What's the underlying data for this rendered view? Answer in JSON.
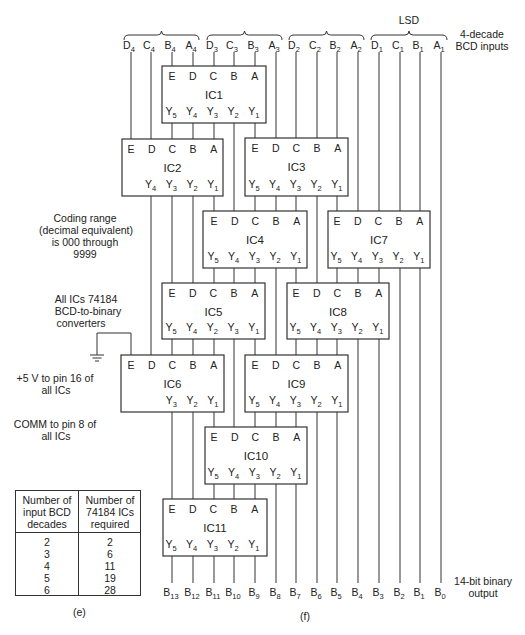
{
  "figure": {
    "caption_e": "(e)",
    "caption_f": "(f)"
  },
  "header": {
    "lsd_label": "LSD",
    "inputs_label_line1": "4-decade",
    "inputs_label_line2": "BCD inputs"
  },
  "inputs": [
    {
      "letter": "D",
      "sub": "4",
      "x": 131
    },
    {
      "letter": "C",
      "sub": "4",
      "x": 151
    },
    {
      "letter": "B",
      "sub": "4",
      "x": 172
    },
    {
      "letter": "A",
      "sub": "4",
      "x": 193
    },
    {
      "letter": "D",
      "sub": "3",
      "x": 214
    },
    {
      "letter": "C",
      "sub": "3",
      "x": 234
    },
    {
      "letter": "B",
      "sub": "3",
      "x": 255
    },
    {
      "letter": "A",
      "sub": "3",
      "x": 276
    },
    {
      "letter": "D",
      "sub": "2",
      "x": 296
    },
    {
      "letter": "C",
      "sub": "2",
      "x": 317
    },
    {
      "letter": "B",
      "sub": "2",
      "x": 337
    },
    {
      "letter": "A",
      "sub": "2",
      "x": 358
    },
    {
      "letter": "D",
      "sub": "1",
      "x": 379
    },
    {
      "letter": "C",
      "sub": "1",
      "x": 400
    },
    {
      "letter": "B",
      "sub": "1",
      "x": 420
    },
    {
      "letter": "A",
      "sub": "1",
      "x": 441
    }
  ],
  "braces": [
    {
      "x1": 124,
      "x2": 199
    },
    {
      "x1": 207,
      "x2": 282
    },
    {
      "x1": 289,
      "x2": 364
    },
    {
      "x1": 371,
      "x2": 447
    }
  ],
  "outputs": [
    {
      "letter": "B",
      "sub": "13",
      "x": 172
    },
    {
      "letter": "B",
      "sub": "12",
      "x": 193
    },
    {
      "letter": "B",
      "sub": "11",
      "x": 214
    },
    {
      "letter": "B",
      "sub": "10",
      "x": 234
    },
    {
      "letter": "B",
      "sub": "9",
      "x": 255
    },
    {
      "letter": "B",
      "sub": "8",
      "x": 276
    },
    {
      "letter": "B",
      "sub": "7",
      "x": 296
    },
    {
      "letter": "B",
      "sub": "6",
      "x": 317
    },
    {
      "letter": "B",
      "sub": "5",
      "x": 337
    },
    {
      "letter": "B",
      "sub": "4",
      "x": 358
    },
    {
      "letter": "B",
      "sub": "3",
      "x": 379
    },
    {
      "letter": "B",
      "sub": "2",
      "x": 400
    },
    {
      "letter": "B",
      "sub": "1",
      "x": 420
    },
    {
      "letter": "B",
      "sub": "0",
      "x": 441
    }
  ],
  "output_label_line1": "14-bit binary",
  "output_label_line2": "output",
  "ics": [
    {
      "name": "IC1",
      "x": 162,
      "y": 66,
      "w": 104,
      "h": 57,
      "pin0": 172,
      "inputs": [
        "E",
        "D",
        "C",
        "B",
        "A"
      ],
      "outputs": [
        [
          "Y",
          "5"
        ],
        [
          "Y",
          "4"
        ],
        [
          "Y",
          "3"
        ],
        [
          "Y",
          "2"
        ],
        [
          "Y",
          "1"
        ]
      ]
    },
    {
      "name": "IC2",
      "x": 122,
      "y": 139,
      "w": 101,
      "h": 57,
      "pin0": 131,
      "inputs": [
        "E",
        "D",
        "C",
        "B",
        "A"
      ],
      "outputs": [
        null,
        [
          "Y",
          "4"
        ],
        [
          "Y",
          "3"
        ],
        [
          "Y",
          "2"
        ],
        [
          "Y",
          "1"
        ]
      ]
    },
    {
      "name": "IC3",
      "x": 245,
      "y": 138,
      "w": 103,
      "h": 58,
      "pin0": 255,
      "inputs": [
        "E",
        "D",
        "C",
        "B",
        "A"
      ],
      "outputs": [
        [
          "Y",
          "5"
        ],
        [
          "Y",
          "4"
        ],
        [
          "Y",
          "3"
        ],
        [
          "Y",
          "2"
        ],
        [
          "Y",
          "1"
        ]
      ]
    },
    {
      "name": "IC4",
      "x": 203,
      "y": 211,
      "w": 104,
      "h": 57,
      "pin0": 214,
      "inputs": [
        "E",
        "D",
        "C",
        "B",
        "A"
      ],
      "outputs": [
        [
          "Y",
          "5"
        ],
        [
          "Y",
          "4"
        ],
        [
          "Y",
          "3"
        ],
        [
          "Y",
          "2"
        ],
        [
          "Y",
          "1"
        ]
      ]
    },
    {
      "name": "IC7",
      "x": 328,
      "y": 211,
      "w": 102,
      "h": 57,
      "pin0": 337,
      "inputs": [
        "E",
        "D",
        "C",
        "B",
        "A"
      ],
      "outputs": [
        [
          "Y",
          "5"
        ],
        [
          "Y",
          "4"
        ],
        [
          "Y",
          "3"
        ],
        [
          "Y",
          "2"
        ],
        [
          "Y",
          "1"
        ]
      ]
    },
    {
      "name": "IC5",
      "x": 162,
      "y": 283,
      "w": 103,
      "h": 56,
      "pin0": 172,
      "inputs": [
        "E",
        "D",
        "C",
        "B",
        "A"
      ],
      "outputs": [
        [
          "Y",
          "5"
        ],
        [
          "Y",
          "4"
        ],
        [
          "Y",
          "2"
        ],
        [
          "Y",
          "3"
        ],
        [
          "Y",
          "1"
        ]
      ]
    },
    {
      "name": "IC8",
      "x": 287,
      "y": 283,
      "w": 102,
      "h": 56,
      "pin0": 296,
      "inputs": [
        "E",
        "D",
        "C",
        "B",
        "A"
      ],
      "outputs": [
        [
          "Y",
          "5"
        ],
        [
          "Y",
          "4"
        ],
        [
          "Y",
          "3"
        ],
        [
          "Y",
          "2"
        ],
        [
          "Y",
          "1"
        ]
      ]
    },
    {
      "name": "IC6",
      "x": 121,
      "y": 355,
      "w": 103,
      "h": 57,
      "pin0": 131,
      "inputs": [
        "E",
        "D",
        "C",
        "B",
        "A"
      ],
      "outputs": [
        null,
        null,
        [
          "Y",
          "3"
        ],
        [
          "Y",
          "2"
        ],
        [
          "Y",
          "1"
        ]
      ]
    },
    {
      "name": "IC9",
      "x": 245,
      "y": 355,
      "w": 103,
      "h": 57,
      "pin0": 255,
      "inputs": [
        "E",
        "D",
        "C",
        "B",
        "A"
      ],
      "outputs": [
        [
          "Y",
          "5"
        ],
        [
          "Y",
          "4"
        ],
        [
          "Y",
          "3"
        ],
        [
          "Y",
          "2"
        ],
        [
          "Y",
          "1"
        ]
      ]
    },
    {
      "name": "IC10",
      "x": 205,
      "y": 427,
      "w": 102,
      "h": 57,
      "pin0": 214,
      "inputs": [
        "E",
        "D",
        "C",
        "B",
        "A"
      ],
      "outputs": [
        [
          "Y",
          "5"
        ],
        [
          "Y",
          "4"
        ],
        [
          "Y",
          "3"
        ],
        [
          "Y",
          "2"
        ],
        [
          "Y",
          "1"
        ]
      ]
    },
    {
      "name": "IC11",
      "x": 163,
      "y": 499,
      "w": 104,
      "h": 57,
      "pin0": 172,
      "inputs": [
        "E",
        "D",
        "C",
        "B",
        "A"
      ],
      "outputs": [
        [
          "Y",
          "5"
        ],
        [
          "Y",
          "4"
        ],
        [
          "Y",
          "3"
        ],
        [
          "Y",
          "2"
        ],
        [
          "Y",
          "1"
        ]
      ]
    }
  ],
  "wires": [
    [
      131,
      52,
      131,
      139
    ],
    [
      151,
      52,
      151,
      139
    ],
    [
      172,
      52,
      172,
      66
    ],
    [
      193,
      52,
      193,
      66
    ],
    [
      214,
      52,
      214,
      66
    ],
    [
      234,
      52,
      234,
      66
    ],
    [
      255,
      52,
      255,
      66
    ],
    [
      276,
      52,
      276,
      138
    ],
    [
      296,
      52,
      296,
      138
    ],
    [
      317,
      52,
      317,
      138
    ],
    [
      337,
      52,
      337,
      138
    ],
    [
      358,
      52,
      358,
      211
    ],
    [
      379,
      52,
      379,
      211
    ],
    [
      400,
      52,
      400,
      211
    ],
    [
      420,
      52,
      420,
      211
    ],
    [
      441,
      52,
      441,
      583
    ],
    [
      172,
      123,
      172,
      139
    ],
    [
      193,
      123,
      193,
      139
    ],
    [
      214,
      123,
      214,
      139
    ],
    [
      234,
      123,
      234,
      211
    ],
    [
      255,
      123,
      255,
      138
    ],
    [
      151,
      196,
      151,
      355
    ],
    [
      172,
      196,
      172,
      283
    ],
    [
      193,
      196,
      193,
      283
    ],
    [
      214,
      196,
      214,
      211
    ],
    [
      255,
      196,
      255,
      211
    ],
    [
      276,
      196,
      276,
      211
    ],
    [
      296,
      196,
      296,
      211
    ],
    [
      317,
      196,
      317,
      283
    ],
    [
      337,
      196,
      337,
      211
    ],
    [
      214,
      268,
      214,
      283
    ],
    [
      234,
      268,
      234,
      283
    ],
    [
      255,
      268,
      255,
      283
    ],
    [
      276,
      268,
      276,
      355
    ],
    [
      296,
      268,
      296,
      283
    ],
    [
      337,
      268,
      337,
      283
    ],
    [
      358,
      268,
      358,
      283
    ],
    [
      379,
      268,
      379,
      283
    ],
    [
      400,
      268,
      400,
      583
    ],
    [
      420,
      268,
      420,
      583
    ],
    [
      172,
      339,
      172,
      355
    ],
    [
      193,
      339,
      193,
      355
    ],
    [
      214,
      339,
      214,
      355
    ],
    [
      234,
      339,
      234,
      427
    ],
    [
      255,
      339,
      255,
      355
    ],
    [
      296,
      339,
      296,
      355
    ],
    [
      317,
      339,
      317,
      355
    ],
    [
      337,
      339,
      337,
      355
    ],
    [
      358,
      339,
      358,
      583
    ],
    [
      379,
      339,
      379,
      583
    ],
    [
      172,
      412,
      172,
      499
    ],
    [
      193,
      412,
      193,
      499
    ],
    [
      214,
      412,
      214,
      427
    ],
    [
      255,
      412,
      255,
      427
    ],
    [
      276,
      412,
      276,
      427
    ],
    [
      296,
      412,
      296,
      427
    ],
    [
      317,
      412,
      317,
      583
    ],
    [
      337,
      412,
      337,
      583
    ],
    [
      214,
      484,
      214,
      499
    ],
    [
      234,
      484,
      234,
      499
    ],
    [
      255,
      484,
      255,
      499
    ],
    [
      276,
      484,
      276,
      583
    ],
    [
      296,
      484,
      296,
      583
    ],
    [
      172,
      556,
      172,
      583
    ],
    [
      193,
      556,
      193,
      583
    ],
    [
      214,
      556,
      214,
      583
    ],
    [
      234,
      556,
      234,
      583
    ],
    [
      255,
      556,
      255,
      583
    ],
    [
      131,
      333,
      131,
      355
    ],
    [
      97,
      333,
      131,
      333
    ],
    [
      97,
      333,
      97,
      355
    ]
  ],
  "ground": {
    "x": 97,
    "y": 355
  },
  "notes": {
    "coding_range": [
      "Coding range",
      "(decimal equivalent)",
      "is 000 through",
      "9999"
    ],
    "all_ics": [
      "All ICs 74184",
      "BCD-to-binary",
      "converters"
    ],
    "power": [
      "+5 V to pin 16 of",
      "all ICs"
    ],
    "comm": [
      "COMM to pin 8 of",
      "all ICs"
    ]
  },
  "table": {
    "headers": [
      "Number of input BCD decades",
      "Number of 74184 ICs required"
    ],
    "header_lines": [
      [
        "Number of",
        "input BCD",
        "decades"
      ],
      [
        "Number of",
        "74184 ICs",
        "required"
      ]
    ],
    "rows": [
      {
        "decades": "2",
        "ics": "2"
      },
      {
        "decades": "3",
        "ics": "6"
      },
      {
        "decades": "4",
        "ics": "11"
      },
      {
        "decades": "5",
        "ics": "19"
      },
      {
        "decades": "6",
        "ics": "28"
      }
    ]
  }
}
